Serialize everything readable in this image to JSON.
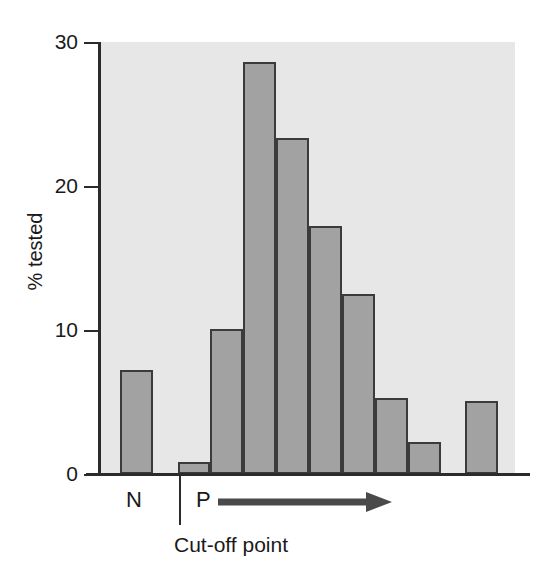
{
  "chart_data": {
    "type": "bar",
    "title": "",
    "subtitle": "",
    "xlabel": "",
    "ylabel": "% tested",
    "ylim": [
      0,
      30
    ],
    "y_ticks": [
      0,
      10,
      20,
      30
    ],
    "y_tick_labels": [
      "0",
      "10",
      "20",
      "30"
    ],
    "grid": false,
    "legend": null,
    "categories": [
      "N",
      "gap1",
      "b1",
      "b2",
      "b3",
      "b4",
      "b5",
      "b6",
      "b7",
      "b8",
      "gap2",
      "b9"
    ],
    "values": [
      7.2,
      0,
      0.8,
      10.1,
      28.6,
      23.3,
      17.2,
      12.5,
      5.3,
      2.2,
      0,
      5.1
    ],
    "bars": [
      {
        "name": "bar-negative",
        "value": 7.2,
        "x": 20,
        "width": 33
      },
      {
        "name": "bar-cutoff-first",
        "value": 0.8,
        "x": 78,
        "width": 32
      },
      {
        "name": "bar-2",
        "value": 10.1,
        "x": 110,
        "width": 33
      },
      {
        "name": "bar-3",
        "value": 28.6,
        "x": 143,
        "width": 33
      },
      {
        "name": "bar-4",
        "value": 23.3,
        "x": 176,
        "width": 33
      },
      {
        "name": "bar-5",
        "value": 17.2,
        "x": 209,
        "width": 33
      },
      {
        "name": "bar-6",
        "value": 12.5,
        "x": 242,
        "width": 33
      },
      {
        "name": "bar-7",
        "value": 5.3,
        "x": 275,
        "width": 33
      },
      {
        "name": "bar-8",
        "value": 2.2,
        "x": 308,
        "width": 33
      },
      {
        "name": "bar-9",
        "value": 5.1,
        "x": 365,
        "width": 33
      }
    ],
    "annotations": [
      {
        "name": "negative-marker",
        "text": "N"
      },
      {
        "name": "positive-marker",
        "text": "P"
      },
      {
        "name": "cutoff-annotation",
        "text": "Cut-off point"
      },
      {
        "name": "increasing-titre-arrow",
        "text": ""
      }
    ],
    "colors": {
      "bar_fill": "#a2a2a2",
      "bar_border": "#3b3b3b",
      "plot_background": "#e7e7e7",
      "axis": "#2b2b2b",
      "text": "#1a1a1a",
      "arrow": "#4a4a4a"
    }
  },
  "axis": {
    "y_label": "% tested",
    "ticks": [
      {
        "label": "30",
        "value": 30
      },
      {
        "label": "20",
        "value": 20
      },
      {
        "label": "10",
        "value": 10
      },
      {
        "label": "0",
        "value": 0
      }
    ]
  },
  "labels": {
    "negative": "N",
    "positive": "P",
    "cutoff": "Cut-off point"
  }
}
